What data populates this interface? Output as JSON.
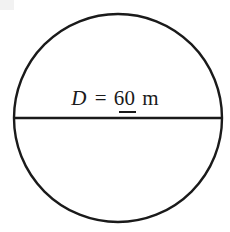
{
  "figure": {
    "kind": "geometry-diagram",
    "background_color": "#ffffff",
    "stroke_color": "#1a1a1a",
    "text_color": "#1a1a1a",
    "canvas": {
      "width": 230,
      "height": 232
    }
  },
  "shapes": {
    "circle": {
      "name": "circle",
      "center_x": 118,
      "center_y": 118,
      "radius": 104,
      "stroke_width": 2.4,
      "fill": "none"
    },
    "diameter": {
      "name": "diameter-line",
      "x1": 14,
      "y1": 118,
      "x2": 222,
      "y2": 118,
      "stroke_width": 2.4
    }
  },
  "label": {
    "full_text": "D = 60 m",
    "variable": "D",
    "equals": "=",
    "value": "60",
    "unit": "m",
    "value_underlined": true
  },
  "chart_data": {
    "type": "diagram",
    "title": "",
    "shape": "circle",
    "measurements": [
      {
        "symbol": "D",
        "quantity": "diameter",
        "value": 60,
        "unit": "m"
      }
    ],
    "annotations": [
      "D = 60 m"
    ]
  }
}
